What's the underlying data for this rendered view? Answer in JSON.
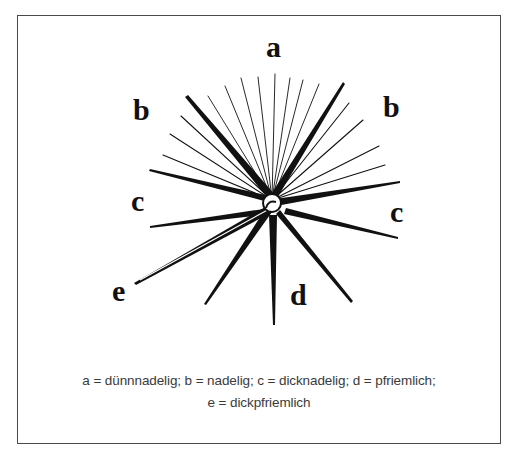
{
  "diagram": {
    "labels": {
      "a": "a",
      "b_left": "b",
      "b_right": "b",
      "c_left": "c",
      "c_right": "c",
      "d": "d",
      "e": "e"
    },
    "caption": {
      "line1": "a = dünnnadelig; b = nadelig; c = dicknadelig; d = pfriemlich;",
      "line2": "e = dickpfriemlich"
    },
    "legend": [
      {
        "key": "a",
        "meaning": "dünnnadelig"
      },
      {
        "key": "b",
        "meaning": "nadelig"
      },
      {
        "key": "c",
        "meaning": "dicknadelig"
      },
      {
        "key": "d",
        "meaning": "pfriemlich"
      },
      {
        "key": "e",
        "meaning": "dickpfriemlich"
      }
    ],
    "colors": {
      "ink": "#111111",
      "caption": "#3a3a3a",
      "frame": "#4a4a4a"
    }
  }
}
